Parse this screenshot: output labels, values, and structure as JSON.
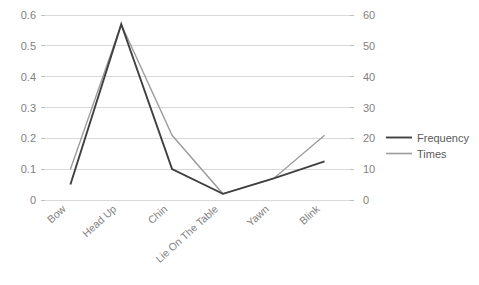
{
  "chart_data": {
    "type": "line",
    "title": "",
    "subtitle": "",
    "xlabel": "",
    "ylabel": "",
    "categories": [
      "Bow",
      "Head Up",
      "Chin",
      "Lie On The Table",
      "Yawn",
      "Blink"
    ],
    "series": [
      {
        "name": "Frequency",
        "axis": "left",
        "color": "#404040",
        "values": [
          0.05,
          0.57,
          0.1,
          0.02,
          0.07,
          0.125
        ]
      },
      {
        "name": "Times",
        "axis": "right",
        "color": "#9c9c9c",
        "values": [
          10,
          57,
          21,
          2,
          7,
          21
        ]
      }
    ],
    "axes": {
      "left": {
        "ticks": [
          "0",
          "0.1",
          "0.2",
          "0.3",
          "0.4",
          "0.5",
          "0.6"
        ],
        "values": [
          0,
          0.1,
          0.2,
          0.3,
          0.4,
          0.5,
          0.6
        ],
        "min": 0,
        "max": 0.6
      },
      "right": {
        "ticks": [
          "0",
          "10",
          "20",
          "30",
          "40",
          "50",
          "60"
        ],
        "values": [
          0,
          10,
          20,
          30,
          40,
          50,
          60
        ],
        "min": 0,
        "max": 60
      }
    },
    "grid": true,
    "legend": {
      "position": "right",
      "entries": [
        {
          "label": "Frequency",
          "color": "#404040"
        },
        {
          "label": "Times",
          "color": "#9c9c9c"
        }
      ]
    }
  }
}
